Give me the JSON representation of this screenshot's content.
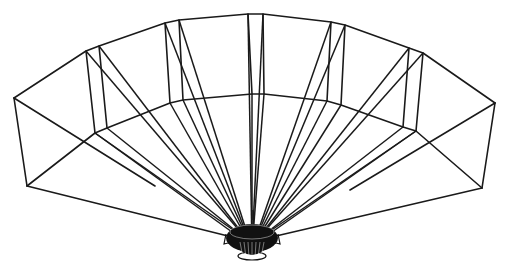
{
  "figure": {
    "line_color": "#1a1a1a",
    "background": "#ffffff",
    "hub": {
      "cx": 252,
      "cy": 240,
      "rx": 26,
      "ry": 18
    },
    "outer_arc": [
      [
        14,
        98
      ],
      [
        86,
        51
      ],
      [
        99,
        46
      ],
      [
        165,
        23
      ],
      [
        179,
        20
      ],
      [
        248,
        14
      ],
      [
        263,
        14
      ],
      [
        331,
        22
      ],
      [
        345,
        25
      ],
      [
        409,
        48
      ],
      [
        423,
        53
      ],
      [
        495,
        103
      ]
    ],
    "inner_arc": [
      [
        95,
        133
      ],
      [
        107,
        128
      ],
      [
        170,
        103
      ],
      [
        183,
        100
      ],
      [
        252,
        94
      ],
      [
        264,
        94
      ],
      [
        327,
        101
      ],
      [
        341,
        105
      ],
      [
        403,
        127
      ],
      [
        416,
        131
      ]
    ],
    "bottom_corners": {
      "left": [
        27,
        186
      ],
      "right": [
        482,
        188
      ]
    },
    "uprights": [
      [
        [
          86,
          51
        ],
        [
          95,
          133
        ]
      ],
      [
        [
          99,
          46
        ],
        [
          107,
          128
        ]
      ],
      [
        [
          165,
          23
        ],
        [
          170,
          103
        ]
      ],
      [
        [
          179,
          20
        ],
        [
          183,
          100
        ]
      ],
      [
        [
          248,
          14
        ],
        [
          252,
          94
        ]
      ],
      [
        [
          263,
          14
        ],
        [
          264,
          94
        ]
      ],
      [
        [
          331,
          22
        ],
        [
          327,
          101
        ]
      ],
      [
        [
          345,
          25
        ],
        [
          341,
          105
        ]
      ],
      [
        [
          409,
          48
        ],
        [
          403,
          127
        ]
      ],
      [
        [
          423,
          53
        ],
        [
          416,
          131
        ]
      ]
    ],
    "rays_from_top": [
      [
        14,
        98
      ],
      [
        86,
        51
      ],
      [
        99,
        46
      ],
      [
        165,
        23
      ],
      [
        179,
        20
      ],
      [
        248,
        14
      ],
      [
        263,
        14
      ],
      [
        331,
        22
      ],
      [
        345,
        25
      ],
      [
        409,
        48
      ],
      [
        423,
        53
      ],
      [
        495,
        103
      ]
    ]
  }
}
